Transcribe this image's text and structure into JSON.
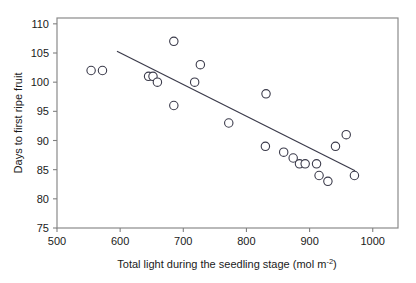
{
  "chart_data": {
    "type": "scatter",
    "title": "",
    "xlabel": "Total light during the seedling stage (mol m-2)",
    "xlabel_main": "Total light during the seedling stage (mol m",
    "xlabel_sup": "-2",
    "xlabel_tail": ")",
    "ylabel": "Days to first ripe fruit",
    "xlim": [
      500,
      1040
    ],
    "ylim": [
      75,
      111
    ],
    "xticks": [
      500,
      600,
      700,
      800,
      900,
      1000
    ],
    "xtick_labels": [
      "500",
      "600",
      "700",
      "800",
      "900",
      "1000"
    ],
    "yticks": [
      75,
      80,
      85,
      90,
      95,
      100,
      105,
      110
    ],
    "ytick_labels": [
      "75",
      "80",
      "85",
      "90",
      "95",
      "100",
      "105",
      "110"
    ],
    "grid": false,
    "legend": "none",
    "marker": "open-circle",
    "marker_color": "#ffffff",
    "marker_edge_color": "#3a3a4a",
    "line_color": "#3a3a4a",
    "axis_color": "#808080",
    "points": [
      {
        "x": 554,
        "y": 102
      },
      {
        "x": 572,
        "y": 102
      },
      {
        "x": 645,
        "y": 101
      },
      {
        "x": 652,
        "y": 101
      },
      {
        "x": 659,
        "y": 100
      },
      {
        "x": 685,
        "y": 107
      },
      {
        "x": 685,
        "y": 96
      },
      {
        "x": 718,
        "y": 100
      },
      {
        "x": 727,
        "y": 103
      },
      {
        "x": 772,
        "y": 93
      },
      {
        "x": 831,
        "y": 98
      },
      {
        "x": 830,
        "y": 89
      },
      {
        "x": 859,
        "y": 88
      },
      {
        "x": 874,
        "y": 87
      },
      {
        "x": 884,
        "y": 86
      },
      {
        "x": 893,
        "y": 86
      },
      {
        "x": 911,
        "y": 86
      },
      {
        "x": 915,
        "y": 84
      },
      {
        "x": 929,
        "y": 83
      },
      {
        "x": 941,
        "y": 89
      },
      {
        "x": 958,
        "y": 91
      },
      {
        "x": 971,
        "y": 84
      }
    ],
    "trendline": {
      "x0": 595,
      "y0": 105.3,
      "x1": 972,
      "y1": 84.8
    }
  }
}
